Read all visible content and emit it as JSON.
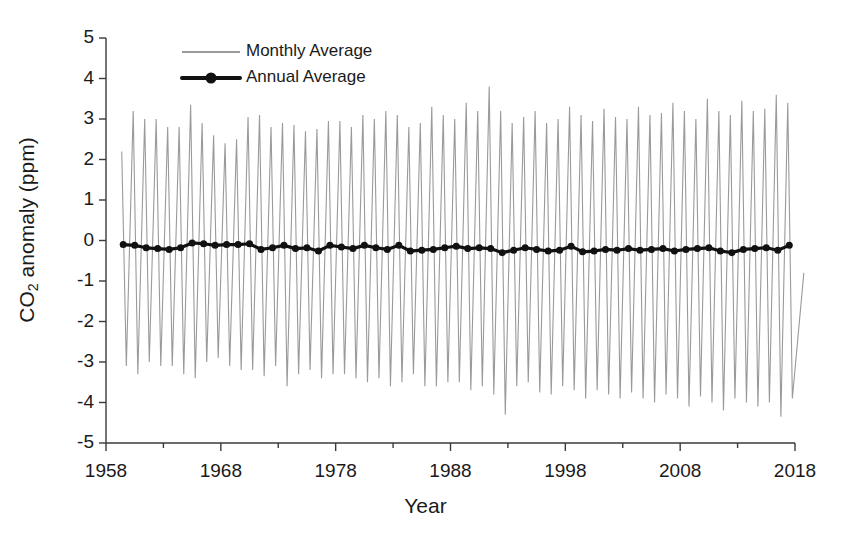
{
  "chart_data": {
    "type": "line",
    "title": "",
    "xlabel": "Year",
    "ylabel": "CO2 anomaly (ppm)",
    "ylabel_parts": {
      "pre": "CO",
      "sub": "2",
      "post": " anomaly (ppm)"
    },
    "xlim": [
      1958,
      2018
    ],
    "ylim": [
      -5,
      5
    ],
    "grid": false,
    "xticks": [
      1958,
      1968,
      1978,
      1988,
      1998,
      2008,
      2018
    ],
    "xtick_labels": [
      "1958",
      "1968",
      "1978",
      "1988",
      "1998",
      "2008",
      "2018"
    ],
    "xminor_ticks": [
      1963,
      1973,
      1983,
      1993,
      2003,
      2013
    ],
    "yticks": [
      5,
      4,
      3,
      2,
      1,
      0,
      -1,
      -2,
      -3,
      -4,
      -5
    ],
    "ytick_labels": [
      "5",
      "4",
      "3",
      "2",
      "1",
      "0",
      "-1",
      "-2",
      "-3",
      "-4",
      "-5"
    ],
    "legend": {
      "position": "top-left-inside",
      "entries": [
        {
          "name": "Monthly Average",
          "color": "#9a9a9a",
          "style": "thin-line"
        },
        {
          "name": "Annual Average",
          "color": "#111111",
          "style": "thick-line-marker"
        }
      ]
    },
    "series": [
      {
        "name": "Monthly Average",
        "color": "#9a9a9a",
        "type": "line",
        "linewidth": 1.1,
        "description": "Monthly CO2 anomaly showing the seasonal cycle, sawtooth oscillation between roughly +3 and -3.5 ppm, amplitude growing slightly over time",
        "seasonal_peaks": {
          "x": [
            1959,
            1960,
            1961,
            1962,
            1963,
            1964,
            1965,
            1966,
            1967,
            1968,
            1969,
            1970,
            1971,
            1972,
            1973,
            1974,
            1975,
            1976,
            1977,
            1978,
            1979,
            1980,
            1981,
            1982,
            1983,
            1984,
            1985,
            1986,
            1987,
            1988,
            1989,
            1990,
            1991,
            1992,
            1993,
            1994,
            1995,
            1996,
            1997,
            1998,
            1999,
            2000,
            2001,
            2002,
            2003,
            2004,
            2005,
            2006,
            2007,
            2008,
            2009,
            2010,
            2011,
            2012,
            2013,
            2014,
            2015,
            2016,
            2017
          ],
          "y": [
            2.2,
            3.2,
            3.0,
            3.0,
            2.8,
            2.8,
            3.35,
            2.9,
            2.6,
            2.4,
            2.5,
            3.05,
            3.1,
            2.8,
            2.9,
            2.85,
            2.7,
            2.75,
            2.95,
            2.95,
            2.8,
            3.1,
            3.0,
            3.2,
            3.1,
            2.8,
            2.9,
            3.3,
            3.1,
            3.0,
            3.4,
            3.2,
            3.8,
            3.2,
            2.9,
            3.05,
            3.2,
            2.9,
            3.0,
            3.3,
            3.1,
            2.95,
            3.25,
            3.05,
            3.0,
            3.3,
            3.1,
            3.15,
            3.4,
            3.2,
            3.0,
            3.5,
            3.2,
            3.1,
            3.45,
            3.2,
            3.25,
            3.6,
            3.4
          ]
        },
        "seasonal_troughs": {
          "x": [
            1959,
            1960,
            1961,
            1962,
            1963,
            1964,
            1965,
            1966,
            1967,
            1968,
            1969,
            1970,
            1971,
            1972,
            1973,
            1974,
            1975,
            1976,
            1977,
            1978,
            1979,
            1980,
            1981,
            1982,
            1983,
            1984,
            1985,
            1986,
            1987,
            1988,
            1989,
            1990,
            1991,
            1992,
            1993,
            1994,
            1995,
            1996,
            1997,
            1998,
            1999,
            2000,
            2001,
            2002,
            2003,
            2004,
            2005,
            2006,
            2007,
            2008,
            2009,
            2010,
            2011,
            2012,
            2013,
            2014,
            2015,
            2016,
            2017,
            2018
          ],
          "y": [
            -3.1,
            -3.3,
            -3.0,
            -3.1,
            -3.1,
            -3.3,
            -3.4,
            -3.0,
            -2.9,
            -3.1,
            -3.2,
            -3.2,
            -3.35,
            -3.1,
            -3.6,
            -3.3,
            -3.2,
            -3.4,
            -3.3,
            -3.3,
            -3.4,
            -3.5,
            -3.4,
            -3.6,
            -3.5,
            -3.3,
            -3.6,
            -3.6,
            -3.5,
            -3.5,
            -3.7,
            -3.6,
            -3.8,
            -4.3,
            -3.6,
            -3.5,
            -3.75,
            -3.8,
            -3.6,
            -3.7,
            -3.9,
            -3.7,
            -3.8,
            -3.9,
            -3.75,
            -3.9,
            -4.0,
            -3.8,
            -3.9,
            -4.1,
            -3.85,
            -4.0,
            -4.2,
            -3.9,
            -4.0,
            -4.1,
            -4.0,
            -4.35,
            -3.9,
            -0.8
          ]
        }
      },
      {
        "name": "Annual Average",
        "color": "#111111",
        "type": "line-marker",
        "linewidth": 3.2,
        "marker": "circle",
        "markersize": 7,
        "x": [
          1959,
          1960,
          1961,
          1962,
          1963,
          1964,
          1965,
          1966,
          1967,
          1968,
          1969,
          1970,
          1971,
          1972,
          1973,
          1974,
          1975,
          1976,
          1977,
          1978,
          1979,
          1980,
          1981,
          1982,
          1983,
          1984,
          1985,
          1986,
          1987,
          1988,
          1989,
          1990,
          1991,
          1992,
          1993,
          1994,
          1995,
          1996,
          1997,
          1998,
          1999,
          2000,
          2001,
          2002,
          2003,
          2004,
          2005,
          2006,
          2007,
          2008,
          2009,
          2010,
          2011,
          2012,
          2013,
          2014,
          2015,
          2016,
          2017
        ],
        "y": [
          -0.1,
          -0.12,
          -0.18,
          -0.2,
          -0.22,
          -0.18,
          -0.06,
          -0.08,
          -0.12,
          -0.1,
          -0.1,
          -0.08,
          -0.22,
          -0.18,
          -0.12,
          -0.2,
          -0.18,
          -0.26,
          -0.12,
          -0.16,
          -0.2,
          -0.12,
          -0.18,
          -0.22,
          -0.12,
          -0.26,
          -0.24,
          -0.22,
          -0.18,
          -0.14,
          -0.2,
          -0.18,
          -0.2,
          -0.3,
          -0.24,
          -0.18,
          -0.22,
          -0.26,
          -0.24,
          -0.14,
          -0.28,
          -0.26,
          -0.22,
          -0.24,
          -0.2,
          -0.24,
          -0.22,
          -0.2,
          -0.26,
          -0.22,
          -0.2,
          -0.18,
          -0.26,
          -0.3,
          -0.22,
          -0.2,
          -0.18,
          -0.24,
          -0.12
        ]
      }
    ]
  }
}
